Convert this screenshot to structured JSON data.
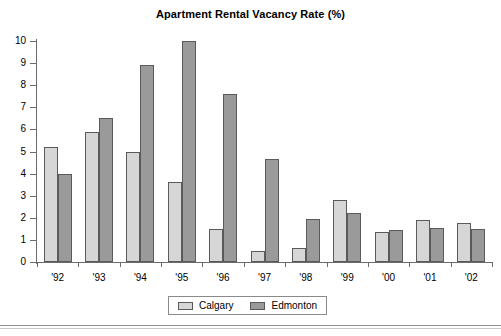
{
  "chart_data": {
    "type": "bar",
    "title": "Apartment Rental Vacancy Rate (%)",
    "xlabel": "",
    "ylabel": "",
    "ylim": [
      0,
      10
    ],
    "ytick_labels": [
      "0",
      "1",
      "2",
      "3",
      "4",
      "5",
      "6",
      "7",
      "8",
      "9",
      "10"
    ],
    "ytick_values": [
      0,
      1,
      2,
      3,
      4,
      5,
      6,
      7,
      8,
      9,
      10
    ],
    "grid": false,
    "legend_position": "bottom",
    "categories": [
      "'92",
      "'93",
      "'94",
      "'95",
      "'96",
      "'97",
      "'98",
      "'99",
      "'00",
      "'01",
      "'02"
    ],
    "series": [
      {
        "name": "Calgary",
        "color": "#d6d6d6",
        "values": [
          5.2,
          5.9,
          5.0,
          3.6,
          1.5,
          0.5,
          0.65,
          2.8,
          1.35,
          1.9,
          1.75
        ]
      },
      {
        "name": "Edmonton",
        "color": "#9a9a9a",
        "values": [
          4.0,
          6.5,
          8.9,
          10.0,
          7.6,
          4.65,
          1.95,
          2.2,
          1.45,
          1.55,
          1.5
        ]
      }
    ]
  },
  "legend": {
    "items": [
      {
        "label": "Calgary",
        "swatch": "calgary"
      },
      {
        "label": "Edmonton",
        "swatch": "edmonton"
      }
    ]
  }
}
